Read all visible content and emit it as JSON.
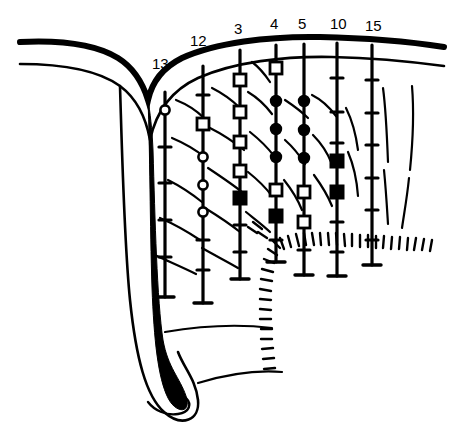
{
  "figure": {
    "background_color": "#ffffff",
    "ink_color": "#000000",
    "width": 464,
    "height": 444
  },
  "columns": [
    {
      "label": "13",
      "label_x": 152,
      "label_y": 55,
      "x": 165,
      "top": 92,
      "bottom": 297,
      "has_top_cap": false,
      "bottom_cap_half_width": 9,
      "ticks": [
        147,
        183,
        220,
        257
      ],
      "markers": [
        {
          "type": "open-circle",
          "y": 110
        }
      ]
    },
    {
      "label": "12",
      "label_x": 190,
      "label_y": 32,
      "x": 203,
      "top": 66,
      "bottom": 303,
      "has_top_cap": false,
      "bottom_cap_half_width": 9,
      "ticks": [
        95,
        240,
        270
      ],
      "markers": [
        {
          "type": "open-square",
          "y": 124
        },
        {
          "type": "open-circle",
          "y": 157
        },
        {
          "type": "open-circle",
          "y": 185
        },
        {
          "type": "open-circle",
          "y": 212
        }
      ]
    },
    {
      "label": "3",
      "label_x": 234,
      "label_y": 20,
      "x": 240,
      "top": 50,
      "bottom": 279,
      "has_top_cap": false,
      "bottom_cap_half_width": 9,
      "ticks": [
        225,
        252
      ],
      "markers": [
        {
          "type": "open-square",
          "y": 80
        },
        {
          "type": "open-square",
          "y": 112
        },
        {
          "type": "open-square",
          "y": 142
        },
        {
          "type": "open-square",
          "y": 171
        },
        {
          "type": "filled-square",
          "y": 198
        }
      ]
    },
    {
      "label": "4",
      "label_x": 270,
      "label_y": 15,
      "x": 276,
      "top": 45,
      "bottom": 262,
      "has_top_cap": false,
      "bottom_cap_half_width": 9,
      "ticks": [
        240
      ],
      "markers": [
        {
          "type": "open-square",
          "y": 68
        },
        {
          "type": "filled-circle",
          "y": 101
        },
        {
          "type": "filled-circle",
          "y": 129
        },
        {
          "type": "filled-circle",
          "y": 157
        },
        {
          "type": "open-square",
          "y": 190
        },
        {
          "type": "filled-square",
          "y": 216
        }
      ]
    },
    {
      "label": "5",
      "label_x": 298,
      "label_y": 15,
      "x": 304,
      "top": 44,
      "bottom": 275,
      "has_top_cap": false,
      "bottom_cap_half_width": 9,
      "ticks": [
        250
      ],
      "markers": [
        {
          "type": "filled-circle",
          "y": 101
        },
        {
          "type": "filled-circle",
          "y": 130
        },
        {
          "type": "filled-circle",
          "y": 158
        },
        {
          "type": "open-square",
          "y": 192
        },
        {
          "type": "open-square",
          "y": 222
        }
      ]
    },
    {
      "label": "10",
      "label_x": 330,
      "label_y": 15,
      "x": 337,
      "top": 43,
      "bottom": 276,
      "has_top_cap": false,
      "bottom_cap_half_width": 9,
      "ticks": [
        78,
        112,
        143,
        222,
        252
      ],
      "markers": [
        {
          "type": "filled-square",
          "y": 161
        },
        {
          "type": "filled-square",
          "y": 192
        }
      ]
    },
    {
      "label": "15",
      "label_x": 365,
      "label_y": 17,
      "x": 372,
      "top": 45,
      "bottom": 265,
      "has_top_cap": false,
      "bottom_cap_half_width": 9,
      "ticks": [
        80,
        113,
        145,
        178,
        210,
        240
      ],
      "markers": []
    }
  ],
  "legend_marker_types": [
    "open-circle",
    "filled-circle",
    "open-square",
    "filled-square",
    "tick"
  ],
  "layers": {
    "surface_thick": "upper bold ground-surface line curving left into fold",
    "surface_thin": "thin secondary bedding line below the surface",
    "fold": "deep narrow synclinal fold at left descending to rounded bottom tip",
    "hatched_boundary": "tick-hatched fault/unconformity boundary running right then turning down",
    "texture_strokes": "short oblique bedding strokes filling the section"
  }
}
